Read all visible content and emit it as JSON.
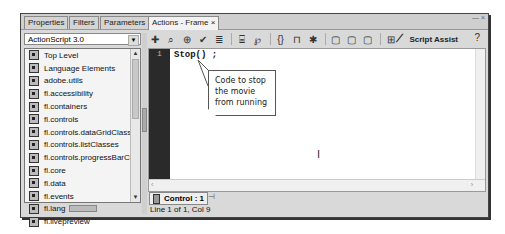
{
  "tabs": [
    {
      "label": "Properties",
      "active": false
    },
    {
      "label": "Filters",
      "active": false
    },
    {
      "label": "Parameters",
      "active": false
    },
    {
      "label": "Actions - Frame",
      "active": true,
      "close": "×"
    }
  ],
  "window_controls": "— ×",
  "language_select": {
    "value": "ActionScript 3.0"
  },
  "toolbox_items": [
    "Top Level",
    "Language Elements",
    "adobe.utils",
    "fl.accessibility",
    "fl.containers",
    "fl.controls",
    "fl.controls.dataGridClasses",
    "fl.controls.listClasses",
    "fl.controls.progressBarCla...",
    "fl.core",
    "fl.data",
    "fl.events",
    "fl.lang",
    "fl.livepreview"
  ],
  "toolbar": {
    "icons": [
      "add-statement",
      "find",
      "insert-target-path",
      "check-syntax",
      "auto-format",
      "show-code-hint",
      "debug-options",
      "collapse-between-braces",
      "collapse-selection",
      "expand-all",
      "apply-block-comment",
      "apply-line-comment",
      "remove-comment",
      "show-hide-toolbox"
    ],
    "script_assist_label": "Script Assist",
    "help": "?"
  },
  "editor": {
    "line_numbers": [
      "1"
    ],
    "lines": [
      "Stop() ;"
    ]
  },
  "callout": {
    "text": "Code to stop the movie from running"
  },
  "footer": {
    "script_tab": "Control : 1",
    "status": "Line 1 of 1, Col 9"
  }
}
